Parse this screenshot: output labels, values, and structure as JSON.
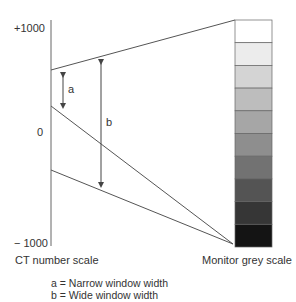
{
  "diagram": {
    "axis_labels": {
      "top": "+1000",
      "zero": "0",
      "bottom": "− 1000"
    },
    "arrow_labels": {
      "a": "a",
      "b": "b"
    },
    "captions": {
      "left": "CT number scale",
      "right": "Monitor grey scale"
    },
    "legend": [
      "a = Narrow window width",
      "b = Wide window width"
    ],
    "grey_scale": [
      "#ffffff",
      "#ececec",
      "#d4d4d4",
      "#bdbdbd",
      "#a6a6a6",
      "#8e8e8e",
      "#727272",
      "#545454",
      "#363636",
      "#141414"
    ],
    "line_color": "#555555"
  }
}
